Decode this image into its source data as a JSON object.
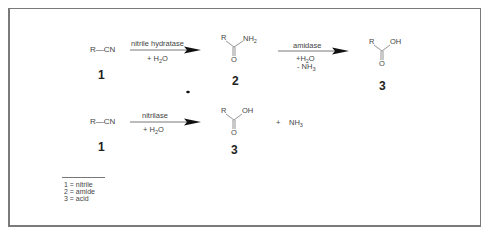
{
  "diagram": {
    "reaction_1": {
      "reactant": {
        "formula": "R—CN",
        "label": "1"
      },
      "step_1": {
        "enzyme": "nitrile hydratase",
        "reagent_prefix": "+ H",
        "reagent_sub": "2",
        "reagent_suffix": "O"
      },
      "intermediate": {
        "r": "R",
        "group": "NH",
        "group_sub": "2",
        "oxygen": "O",
        "label": "2"
      },
      "step_2": {
        "enzyme": "amidase",
        "reagent_1_prefix": "+H",
        "reagent_1_sub": "2",
        "reagent_1_suffix": "O",
        "reagent_2_prefix": "- NH",
        "reagent_2_sub": "3"
      },
      "product": {
        "r": "R",
        "group": "OH",
        "oxygen": "O",
        "label": "3"
      }
    },
    "reaction_2": {
      "reactant": {
        "formula": "R—CN",
        "label": "1"
      },
      "step": {
        "enzyme": "nitrilase",
        "reagent_prefix": "+ H",
        "reagent_sub": "2",
        "reagent_suffix": "O"
      },
      "product": {
        "r": "R",
        "group": "OH",
        "oxygen": "O",
        "label": "3"
      },
      "plus": "+",
      "byproduct": {
        "prefix": "NH",
        "sub": "3"
      }
    },
    "legend": [
      "1 = nitrile",
      "2 = amide",
      "3 = acid"
    ],
    "colors": {
      "line": "#555555",
      "arrow": "#111111",
      "frame": "#7a7a7a"
    }
  }
}
